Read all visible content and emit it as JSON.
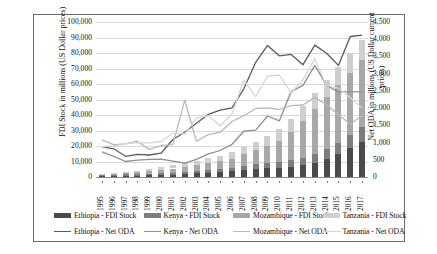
{
  "chart_data": {
    "type": "bar",
    "title": "",
    "subtitle": "",
    "xlabel": "",
    "ylabel": "FDI Stock in millions (US Dollar prices)",
    "y2label": "Net ODA in millions (US Dollar current prices)",
    "grid": true,
    "legend_position": "bottom",
    "bar_mode": "stacked",
    "categories": [
      "1995",
      "1996",
      "1997",
      "1998",
      "1999",
      "2000",
      "2001",
      "2002",
      "2003",
      "2004",
      "2005",
      "2006",
      "2007",
      "2008",
      "2009",
      "2010",
      "2011",
      "2012",
      "2013",
      "2014",
      "2015",
      "2016",
      "2017"
    ],
    "ylim": [
      0,
      100000
    ],
    "y2lim": [
      0,
      4500
    ],
    "yticks": [
      "0",
      "10,000",
      "20,000",
      "30,000",
      "40,000",
      "50,000",
      "60,000",
      "70,000",
      "80,000",
      "90,000",
      "100,000"
    ],
    "ytick_values": [
      0,
      10000,
      20000,
      30000,
      40000,
      50000,
      60000,
      70000,
      80000,
      90000,
      100000
    ],
    "y2ticks": [
      "0",
      "500",
      "1,000",
      "1,500",
      "2,000",
      "2,500",
      "3,000",
      "3,500",
      "4,000",
      "4,500"
    ],
    "y2tick_values": [
      0,
      500,
      1000,
      1500,
      2000,
      2500,
      3000,
      3500,
      4000,
      4500
    ],
    "bar_series": [
      {
        "name": "Ethiopia - FDI Stock",
        "axis": "left",
        "color": "#4a4a4a",
        "values": [
          600,
          700,
          800,
          900,
          1100,
          1300,
          1600,
          2000,
          2400,
          2900,
          3400,
          4000,
          4700,
          5300,
          5600,
          6000,
          6600,
          7500,
          9200,
          11500,
          14800,
          18700,
          22600
        ]
      },
      {
        "name": "Kenya - FDI Stock",
        "axis": "left",
        "color": "#7d7d7d",
        "values": [
          700,
          800,
          900,
          1000,
          1100,
          1200,
          1300,
          1400,
          1500,
          1600,
          1700,
          1900,
          2600,
          2900,
          3200,
          3500,
          4200,
          5000,
          5600,
          6400,
          7400,
          8500,
          9600
        ]
      },
      {
        "name": "Mozambique - FDI Stock",
        "axis": "left",
        "color": "#a8a8a8",
        "values": [
          400,
          600,
          900,
          1200,
          1600,
          2000,
          2600,
          3100,
          3700,
          4400,
          5100,
          6000,
          7300,
          9000,
          11300,
          14000,
          18000,
          23500,
          29000,
          33500,
          37000,
          40000,
          43000
        ]
      },
      {
        "name": "Tanzania - FDI Stock",
        "axis": "left",
        "color": "#cfcfcf",
        "values": [
          500,
          700,
          900,
          1100,
          1400,
          1700,
          2100,
          2400,
          2800,
          3200,
          3600,
          4100,
          4800,
          5600,
          6400,
          7300,
          8400,
          9600,
          10500,
          11300,
          12000,
          12600,
          13200
        ]
      }
    ],
    "line_series": [
      {
        "name": "Ethiopia - Net ODA",
        "axis": "right",
        "color": "#5a5a5a",
        "values": [
          880,
          820,
          600,
          660,
          640,
          690,
          1090,
          1300,
          1560,
          1820,
          1940,
          2010,
          2560,
          3330,
          3820,
          3520,
          3560,
          3260,
          3830,
          3590,
          3240,
          4080,
          4120
        ]
      },
      {
        "name": "Kenya - Net ODA",
        "axis": "right",
        "color": "#8f8f8f",
        "values": [
          730,
          600,
          450,
          490,
          510,
          520,
          460,
          400,
          510,
          670,
          770,
          950,
          1330,
          1360,
          1770,
          1630,
          2480,
          2660,
          3240,
          2660,
          2470,
          2470,
          2480
        ]
      },
      {
        "name": "Mozambique - Net ODA",
        "axis": "right",
        "color": "#b9b9b9",
        "values": [
          1080,
          940,
          960,
          1040,
          800,
          910,
          940,
          2230,
          1040,
          1230,
          1300,
          1610,
          1780,
          1990,
          2010,
          1960,
          2070,
          2090,
          2310,
          2100,
          1810,
          1540,
          1780
        ]
      },
      {
        "name": "Tanzania - Net ODA",
        "axis": "right",
        "color": "#d6d6d6",
        "values": [
          880,
          900,
          970,
          1000,
          990,
          1030,
          1270,
          1250,
          1710,
          1780,
          1480,
          1830,
          2810,
          2330,
          2930,
          2960,
          2440,
          2830,
          3430,
          2650,
          2580,
          2300,
          2000
        ]
      }
    ]
  },
  "legend": {
    "row1": [
      {
        "label": "Ethiopia - FDI Stock",
        "color": "#4a4a4a",
        "marker": "bar"
      },
      {
        "label": "Kenya - FDI Stock",
        "color": "#7d7d7d",
        "marker": "bar"
      },
      {
        "label": "Mozambique - FDI Stock",
        "color": "#a8a8a8",
        "marker": "bar"
      },
      {
        "label": "Tanzania - FDI Stock",
        "color": "#cfcfcf",
        "marker": "bar"
      }
    ],
    "row2": [
      {
        "label": "Ethiopia - Net ODA",
        "color": "#5a5a5a",
        "marker": "line"
      },
      {
        "label": "Kenya - Net ODA",
        "color": "#8f8f8f",
        "marker": "line"
      },
      {
        "label": "Mozambique - Net ODA",
        "color": "#b9b9b9",
        "marker": "line"
      },
      {
        "label": "Tanzania - Net ODA",
        "color": "#d6d6d6",
        "marker": "line"
      }
    ]
  }
}
